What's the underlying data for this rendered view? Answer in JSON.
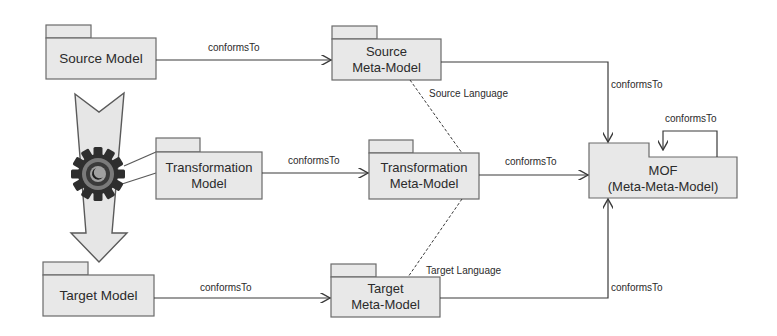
{
  "diagram": {
    "colors": {
      "box_fill": "#e8e8e8",
      "stroke": "#5a5a5a",
      "line": "#3a3a3a",
      "arrow_fill": "#e6e6e6",
      "gear_dark": "#2e2e2e",
      "gear_mid": "#8a8a8a"
    },
    "nodes": {
      "source_model": {
        "lines": [
          "Source Model"
        ]
      },
      "transformation_model": {
        "lines": [
          "Transformation",
          "Model"
        ]
      },
      "target_model": {
        "lines": [
          "Target Model"
        ]
      },
      "source_meta_model": {
        "lines": [
          "Source",
          "Meta-Model"
        ]
      },
      "transformation_meta_model": {
        "lines": [
          "Transformation",
          "Meta-Model"
        ]
      },
      "target_meta_model": {
        "lines": [
          "Target",
          "Meta-Model"
        ]
      },
      "mof": {
        "lines": [
          "MOF",
          "(Meta-Meta-Model)"
        ]
      }
    },
    "edges": {
      "source_to_meta": "conformsTo",
      "transformation_to_meta": "conformsTo",
      "target_to_meta": "conformsTo",
      "source_meta_to_mof": "conformsTo",
      "transformation_meta_to_mof": "conformsTo",
      "target_meta_to_mof": "conformsTo",
      "mof_self": "conformsTo",
      "source_language": "Source Language",
      "target_language": "Target Language"
    },
    "icons": {
      "gear": "gear-icon",
      "transformation_arrow": "down-arrow-icon"
    }
  }
}
